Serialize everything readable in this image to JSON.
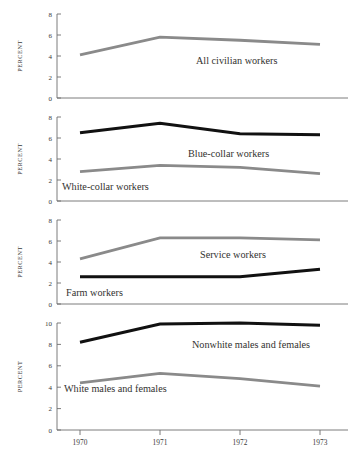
{
  "figure": {
    "y_axis_title": "PERCENT",
    "x_tick_labels": [
      "1970",
      "1971",
      "1972",
      "1973"
    ],
    "colors": {
      "black_series": "#111111",
      "gray_series": "#8a8a8a",
      "axis": "#6e6e6e",
      "text": "#32322f",
      "background": "#ffffff"
    }
  },
  "chart_data": {
    "type": "line",
    "title": "",
    "xlabel": "",
    "ylabel": "PERCENT",
    "x": [
      1970,
      1971,
      1972,
      1973
    ],
    "grid": false,
    "legend": "inline-annotations",
    "panels": [
      {
        "index": 1,
        "ylim": [
          0,
          8
        ],
        "yticks": [
          0,
          2,
          4,
          6,
          8
        ],
        "ytick_labels": [
          "0",
          "2",
          "4",
          "6",
          "8"
        ],
        "series": [
          {
            "name": "All civilian workers",
            "color": "#8a8a8a",
            "values": [
              4.1,
              5.8,
              5.5,
              5.1
            ],
            "label": "All civilian workers"
          }
        ]
      },
      {
        "index": 2,
        "ylim": [
          0,
          8
        ],
        "yticks": [
          0,
          2,
          4,
          6,
          8
        ],
        "ytick_labels": [
          "0",
          "2",
          "4",
          "6",
          "8"
        ],
        "series": [
          {
            "name": "Blue-collar workers",
            "color": "#111111",
            "values": [
              6.5,
              7.4,
              6.4,
              6.3
            ],
            "label": "Blue-collar workers"
          },
          {
            "name": "White-collar workers",
            "color": "#8a8a8a",
            "values": [
              2.8,
              3.4,
              3.2,
              2.6
            ],
            "label": "White-collar workers"
          }
        ]
      },
      {
        "index": 3,
        "ylim": [
          0,
          8
        ],
        "yticks": [
          0,
          2,
          4,
          6,
          8
        ],
        "ytick_labels": [
          "0",
          "2",
          "4",
          "6",
          "8"
        ],
        "series": [
          {
            "name": "Service workers",
            "color": "#8a8a8a",
            "values": [
              4.3,
              6.3,
              6.3,
              6.1
            ],
            "label": "Service workers"
          },
          {
            "name": "Farm workers",
            "color": "#111111",
            "values": [
              2.6,
              2.6,
              2.6,
              3.3
            ],
            "label": "Farm workers"
          }
        ]
      },
      {
        "index": 4,
        "ylim": [
          0,
          10
        ],
        "yticks": [
          0,
          2,
          4,
          6,
          8,
          10
        ],
        "ytick_labels": [
          "0",
          "2",
          "4",
          "6",
          "8",
          "10"
        ],
        "series": [
          {
            "name": "Nonwhite males and females",
            "color": "#111111",
            "values": [
              8.2,
              9.9,
              10.0,
              9.8
            ],
            "label": "Nonwhite males and females"
          },
          {
            "name": "White males and females",
            "color": "#8a8a8a",
            "values": [
              4.4,
              5.3,
              4.8,
              4.1
            ],
            "label": "White males and females"
          }
        ]
      }
    ]
  }
}
